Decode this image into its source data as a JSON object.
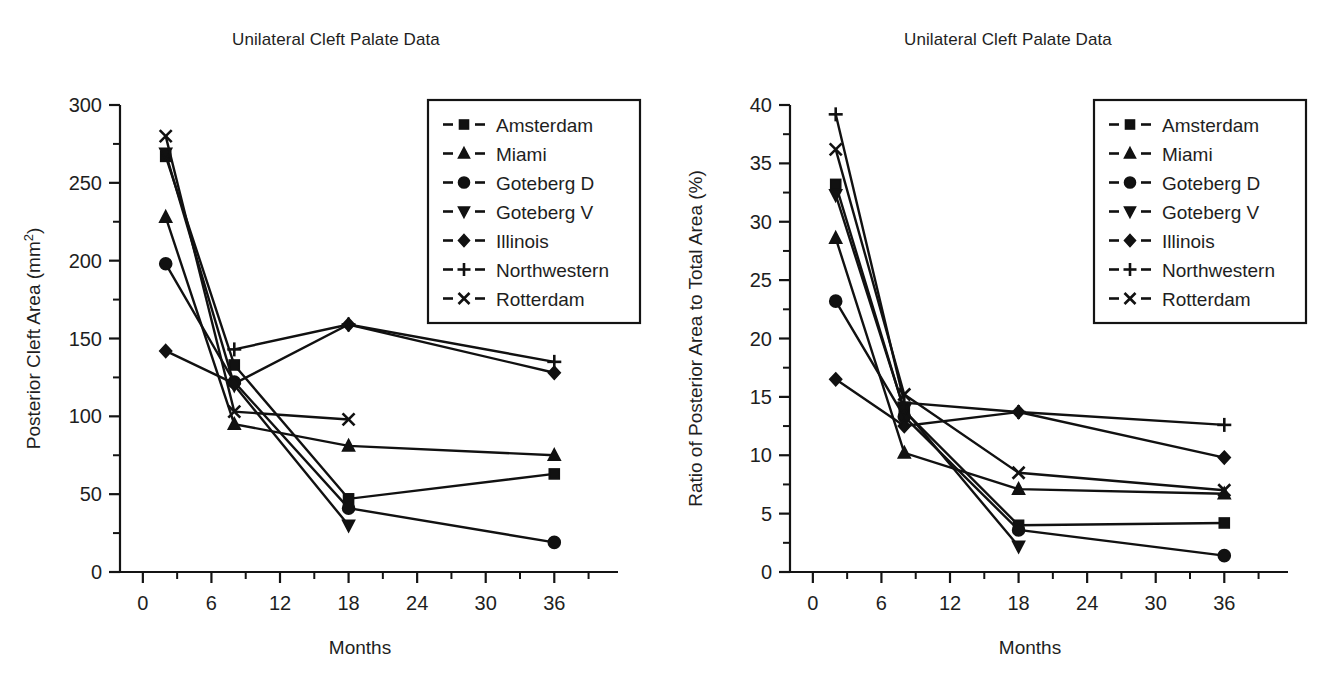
{
  "figure": {
    "panel_count": 2
  },
  "legend": {
    "entries": [
      {
        "label": "Amsterdam",
        "marker": "square"
      },
      {
        "label": "Miami",
        "marker": "triangle-up"
      },
      {
        "label": "Goteberg D",
        "marker": "circle"
      },
      {
        "label": "Goteberg V",
        "marker": "triangle-down"
      },
      {
        "label": "Illinois",
        "marker": "diamond"
      },
      {
        "label": "Northwestern",
        "marker": "plus"
      },
      {
        "label": "Rotterdam",
        "marker": "cross"
      }
    ],
    "line_style": "dashed-with-marker"
  },
  "chart_data": [
    {
      "id": "left",
      "type": "line",
      "title": "Unilateral Cleft Palate Data",
      "xlabel": "Months",
      "ylabel": "Posterior Cleft Area (mm²)",
      "xlim": [
        -2,
        40
      ],
      "ylim": [
        0,
        300
      ],
      "xticks": [
        0,
        6,
        12,
        18,
        24,
        30,
        36
      ],
      "xtick_labels": [
        "0",
        "6",
        "12",
        "18",
        "24",
        "30",
        "36"
      ],
      "xminor_step": 3,
      "yticks": [
        0,
        50,
        100,
        150,
        200,
        250,
        300
      ],
      "ytick_labels": [
        "0",
        "50",
        "100",
        "150",
        "200",
        "250",
        "300"
      ],
      "yminor_step": 25,
      "grid": false,
      "legend_position": "upper-right",
      "series": [
        {
          "name": "Amsterdam",
          "marker": "square",
          "x": [
            2,
            8,
            18,
            36
          ],
          "values": [
            267,
            133,
            47,
            63
          ]
        },
        {
          "name": "Miami",
          "marker": "triangle-up",
          "x": [
            2,
            8,
            18,
            36
          ],
          "values": [
            228,
            95,
            81,
            75
          ]
        },
        {
          "name": "Goteberg D",
          "marker": "circle",
          "x": [
            2,
            8,
            18,
            36
          ],
          "values": [
            198,
            122,
            41,
            19
          ]
        },
        {
          "name": "Goteberg V",
          "marker": "triangle-down",
          "x": [
            2,
            8,
            18,
            36
          ],
          "values": [
            269,
            120,
            30,
            null
          ]
        },
        {
          "name": "Illinois",
          "marker": "diamond",
          "x": [
            2,
            8,
            18,
            36
          ],
          "values": [
            142,
            121,
            159,
            128
          ]
        },
        {
          "name": "Northwestern",
          "marker": "plus",
          "x": [
            2,
            8,
            18,
            36
          ],
          "values": [
            null,
            143,
            159,
            135
          ]
        },
        {
          "name": "Rotterdam",
          "marker": "cross",
          "x": [
            2,
            8,
            18,
            36
          ],
          "values": [
            280,
            103,
            98,
            null
          ]
        }
      ]
    },
    {
      "id": "right",
      "type": "line",
      "title": "Unilateral Cleft Palate Data",
      "xlabel": "Months",
      "ylabel": "Ratio of Posterior Area to Total Area (%)",
      "xlim": [
        -2,
        40
      ],
      "ylim": [
        0,
        40
      ],
      "xticks": [
        0,
        6,
        12,
        18,
        24,
        30,
        36
      ],
      "xtick_labels": [
        "0",
        "6",
        "12",
        "18",
        "24",
        "30",
        "36"
      ],
      "xminor_step": 3,
      "yticks": [
        0,
        5,
        10,
        15,
        20,
        25,
        30,
        35,
        40
      ],
      "ytick_labels": [
        "0",
        "5",
        "10",
        "15",
        "20",
        "25",
        "30",
        "35",
        "40"
      ],
      "yminor_step": 2.5,
      "grid": false,
      "legend_position": "upper-right",
      "series": [
        {
          "name": "Amsterdam",
          "marker": "square",
          "x": [
            2,
            8,
            18,
            36
          ],
          "values": [
            33.2,
            13.8,
            4.0,
            4.2
          ]
        },
        {
          "name": "Miami",
          "marker": "triangle-up",
          "x": [
            2,
            8,
            18,
            36
          ],
          "values": [
            28.6,
            10.2,
            7.1,
            6.7
          ]
        },
        {
          "name": "Goteberg D",
          "marker": "circle",
          "x": [
            2,
            8,
            18,
            36
          ],
          "values": [
            23.2,
            13.3,
            3.6,
            1.4
          ]
        },
        {
          "name": "Goteberg V",
          "marker": "triangle-down",
          "x": [
            2,
            8,
            18,
            36
          ],
          "values": [
            32.3,
            13.9,
            2.2,
            null
          ]
        },
        {
          "name": "Illinois",
          "marker": "diamond",
          "x": [
            2,
            8,
            18,
            36
          ],
          "values": [
            16.5,
            12.5,
            13.7,
            9.8
          ]
        },
        {
          "name": "Northwestern",
          "marker": "plus",
          "x": [
            2,
            8,
            18,
            36
          ],
          "values": [
            39.2,
            14.5,
            13.7,
            12.6
          ]
        },
        {
          "name": "Rotterdam",
          "marker": "cross",
          "x": [
            2,
            8,
            18,
            36
          ],
          "values": [
            36.2,
            15.2,
            8.5,
            7.0
          ]
        }
      ]
    }
  ],
  "colors": {
    "ink": "#111111",
    "background": "#ffffff"
  }
}
